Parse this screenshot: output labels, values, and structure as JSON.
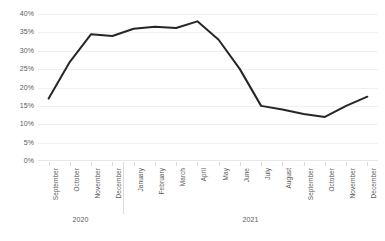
{
  "chart_data": {
    "type": "line",
    "title": "",
    "xlabel": "",
    "ylabel": "",
    "ylim": [
      0,
      40
    ],
    "grid": true,
    "legend": false,
    "y_ticks": [
      "0%",
      "5%",
      "10%",
      "15%",
      "20%",
      "25%",
      "30%",
      "35%",
      "40%"
    ],
    "y_tick_values": [
      0,
      5,
      10,
      15,
      20,
      25,
      30,
      35,
      40
    ],
    "categories": [
      "September",
      "October",
      "November",
      "December",
      "January",
      "February",
      "March",
      "April",
      "May",
      "June",
      "July",
      "August",
      "September",
      "October",
      "November",
      "December"
    ],
    "values": [
      17,
      27,
      34.5,
      34,
      36,
      36.5,
      36.2,
      38,
      33,
      25,
      15,
      14,
      12.8,
      12,
      15,
      17.5
    ],
    "series": [
      {
        "name": "Series 1",
        "color": "#262626",
        "values": [
          17,
          27,
          34.5,
          34,
          36,
          36.5,
          36.2,
          38,
          33,
          25,
          15,
          14,
          12.8,
          12,
          15,
          17.5
        ]
      }
    ],
    "year_groups": [
      {
        "label": "2020",
        "start_index": 0,
        "end_index": 3
      },
      {
        "label": "2021",
        "start_index": 4,
        "end_index": 15
      }
    ],
    "colors": {
      "line": "#262626",
      "gridline": "#f0f0f0",
      "axis": "#d9d9d9",
      "text": "#5a5a5a",
      "background": "#ffffff"
    }
  }
}
